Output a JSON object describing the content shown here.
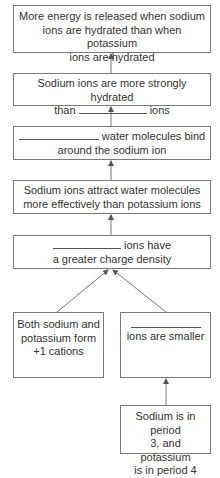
{
  "diagram": {
    "type": "flowchart",
    "direction": "bottom-to-top",
    "colors": {
      "border": "#7a7a7a",
      "text": "#333333",
      "arrow": "#777777"
    },
    "boxes": [
      {
        "id": "b1",
        "lines": [
          "More energy is released when sodium",
          "ions are hydrated than when potassium",
          "ions are hydrated"
        ]
      },
      {
        "id": "b2",
        "line1": "Sodium ions are more strongly hydrated",
        "line2_pre": "than",
        "line2_post": "ions",
        "blank": true
      },
      {
        "id": "b3",
        "line1_post": "water molecules bind",
        "line2": "around the sodium ion",
        "blank": true
      },
      {
        "id": "b4",
        "lines": [
          "Sodium ions attract water molecules",
          "more effectively than potassium ions"
        ]
      },
      {
        "id": "b5",
        "line1_post": "ions have",
        "line2": "a greater charge density",
        "blank": true
      },
      {
        "id": "b6",
        "lines": [
          "Both sodium and",
          "potassium form",
          "+1 cations"
        ]
      },
      {
        "id": "b7",
        "line2": "ions are smaller",
        "blank": true
      },
      {
        "id": "b8",
        "lines": [
          "Sodium is in period",
          "3, and potassium",
          "is in period 4"
        ]
      }
    ],
    "arrows": [
      {
        "from": "b2",
        "to": "b1"
      },
      {
        "from": "b3",
        "to": "b2"
      },
      {
        "from": "b4",
        "to": "b3"
      },
      {
        "from": "b5",
        "to": "b4"
      },
      {
        "from": "b6",
        "to": "b5"
      },
      {
        "from": "b7",
        "to": "b5"
      },
      {
        "from": "b8",
        "to": "b7"
      }
    ]
  }
}
